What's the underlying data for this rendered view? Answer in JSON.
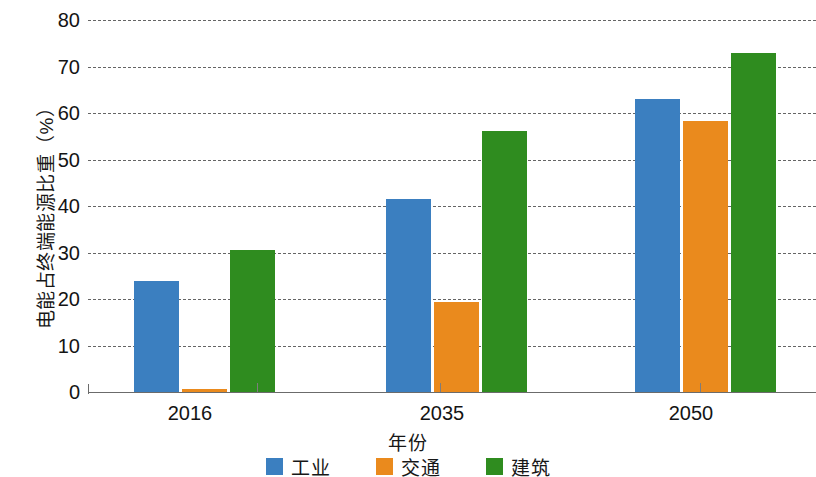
{
  "chart_data": {
    "type": "bar",
    "title": "",
    "xlabel": "年份",
    "ylabel": "电能占终端能源比重（%）",
    "categories": [
      "2016",
      "2035",
      "2050"
    ],
    "series": [
      {
        "name": "工业",
        "color": "#3b7fc0",
        "values": [
          23.8,
          41.6,
          63.0
        ]
      },
      {
        "name": "交通",
        "color": "#ea8a1d",
        "values": [
          0.7,
          19.4,
          58.2
        ]
      },
      {
        "name": "建筑",
        "color": "#2f8c1f",
        "values": [
          30.6,
          56.2,
          73.0
        ]
      }
    ],
    "ylim": [
      0,
      80
    ],
    "y_ticks": [
      0,
      10,
      20,
      30,
      40,
      50,
      60,
      70,
      80
    ],
    "grid": "horizontal-dashed",
    "legend_position": "bottom-center"
  },
  "axes": {
    "y_tick_labels": [
      "0",
      "10",
      "20",
      "30",
      "40",
      "50",
      "60",
      "70",
      "80"
    ],
    "x_tick_labels": [
      "2016",
      "2035",
      "2050"
    ]
  },
  "legend": {
    "items": [
      {
        "label": "工业",
        "color": "#3b7fc0",
        "swatch_name": "legend-swatch-industry"
      },
      {
        "label": "交通",
        "color": "#ea8a1d",
        "swatch_name": "legend-swatch-transport"
      },
      {
        "label": "建筑",
        "color": "#2f8c1f",
        "swatch_name": "legend-swatch-buildings"
      }
    ]
  },
  "layout": {
    "plot_left": 88,
    "plot_top": 20,
    "plot_width": 728,
    "plot_height": 372,
    "bar_width": 45,
    "group_centers": [
      190,
      442,
      691
    ],
    "bar_offsets": [
      -56,
      -8,
      40
    ],
    "x_tick_positions": [
      257,
      440,
      700
    ]
  }
}
